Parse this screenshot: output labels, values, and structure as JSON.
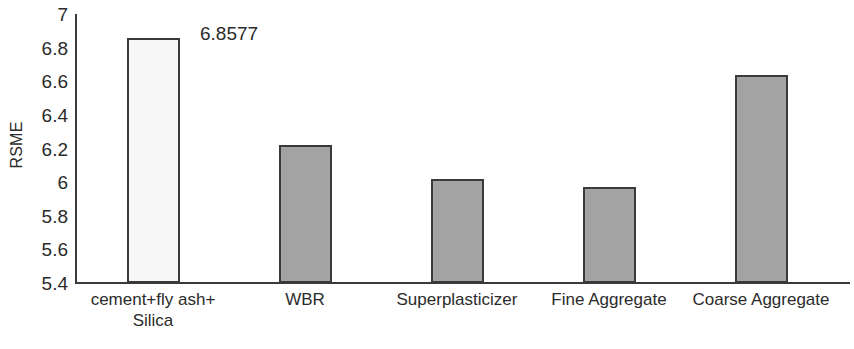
{
  "chart_data": {
    "type": "bar",
    "title": "",
    "xlabel": "",
    "ylabel": "RSME",
    "ylim": [
      5.4,
      7
    ],
    "ytick_step": 0.2,
    "yticks": [
      "7",
      "6.8",
      "6.6",
      "6.4",
      "6.2",
      "6",
      "5.8",
      "5.6",
      "5.4"
    ],
    "grid": false,
    "legend": false,
    "categories": [
      "cement+fly ash+\nSilica",
      "WBR",
      "Superplasticizer",
      "Fine Aggregate",
      "Coarse Aggregate"
    ],
    "category_lines": [
      [
        "cement+fly ash+",
        "Silica"
      ],
      [
        "WBR"
      ],
      [
        "Superplasticizer"
      ],
      [
        "Fine Aggregate"
      ],
      [
        "Coarse Aggregate"
      ]
    ],
    "values": [
      6.8577,
      6.22,
      6.02,
      5.97,
      6.64
    ],
    "data_labels": [
      "6.8577",
      "",
      "",
      "",
      ""
    ],
    "bar_fills": [
      "#f7f7f7",
      "#a3a3a3",
      "#a3a3a3",
      "#a3a3a3",
      "#a3a3a3"
    ],
    "bar_border_color": "#3a3a3a",
    "axis_color": "#3a3a3a",
    "text_color": "#2b2b2b"
  }
}
